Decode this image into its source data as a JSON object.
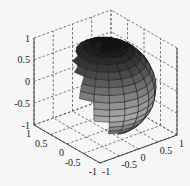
{
  "chart_data": {
    "type": "surface",
    "title": "",
    "xlabel": "",
    "ylabel": "",
    "zlabel": "",
    "xlim": [
      -1,
      1
    ],
    "ylim": [
      -1,
      1
    ],
    "zlim": [
      -1,
      1
    ],
    "x_ticks": [
      "-1",
      "-0.5",
      "0",
      "0.5",
      "1"
    ],
    "y_ticks": [
      "-1",
      "-0.5",
      "0",
      "0.5",
      "1"
    ],
    "z_ticks": [
      "-1",
      "-0.5",
      "0",
      "0.5",
      "1"
    ],
    "grid": true,
    "grid_style": "dashed",
    "colormap": "gray",
    "surface": {
      "shape": "sphere",
      "center": [
        0,
        0,
        0
      ],
      "radius": 1,
      "mesh": 20
    }
  },
  "colors": {
    "background": "#f6f6f6",
    "axis": "#333333",
    "grid": "#555555",
    "sphere_top": "#1a1a1a",
    "sphere_band": "#b5b5b5",
    "sphere_bottom": "#555555",
    "mesh_lines": "#111111"
  }
}
